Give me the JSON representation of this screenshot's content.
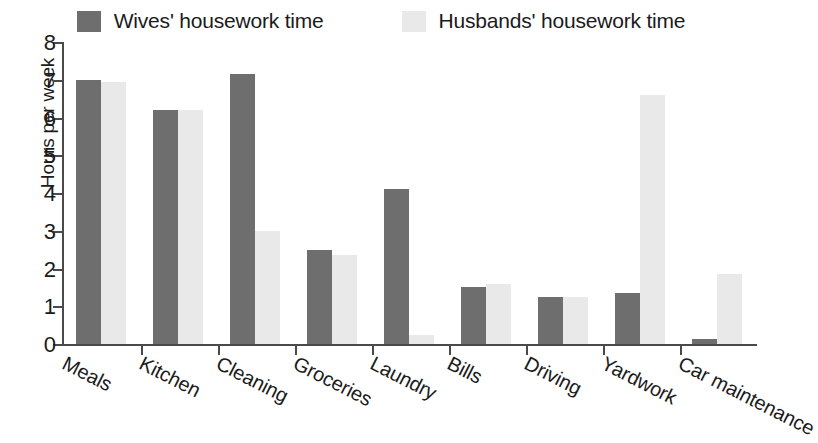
{
  "chart_data": {
    "type": "bar",
    "title": "",
    "xlabel": "",
    "ylabel": "Hours per week",
    "ylim": [
      0,
      8
    ],
    "yticks": [
      0,
      1,
      2,
      3,
      4,
      5,
      6,
      7,
      8
    ],
    "ytick_labels": [
      "0",
      "1",
      "2",
      "3",
      "4",
      "5",
      "6",
      "7",
      "8"
    ],
    "grid": false,
    "legend_position": "top-center",
    "categories": [
      "Meals",
      "Kitchen",
      "Cleaning",
      "Groceries",
      "Laundry",
      "Bills",
      "Driving",
      "Yardwork",
      "Car maintenance"
    ],
    "series": [
      {
        "name": "Wives' housework time",
        "color": "#6e6e6e",
        "values": [
          7.0,
          6.2,
          7.15,
          2.5,
          4.1,
          1.5,
          1.25,
          1.35,
          0.12
        ]
      },
      {
        "name": "Husbands' housework time",
        "color": "#e9e9e9",
        "values": [
          6.95,
          6.2,
          3.0,
          2.35,
          0.25,
          1.6,
          1.25,
          6.6,
          1.85
        ]
      }
    ]
  },
  "legend": {
    "entries": [
      {
        "label": "Wives' housework time",
        "swatch": "dark"
      },
      {
        "label": "Husbands' housework time",
        "swatch": "light"
      }
    ]
  }
}
